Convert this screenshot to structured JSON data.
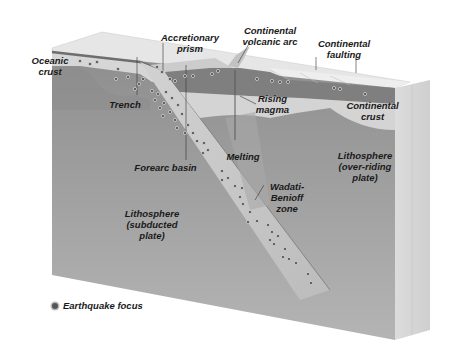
{
  "diagram": {
    "type": "block-diagram",
    "labels": {
      "oceanic_crust": "Oceanic\ncrust",
      "accretionary_prism": "Accretionary\nprism",
      "continental_volcanic_arc": "Continental\nvolcanic arc",
      "continental_faulting": "Continental\nfaulting",
      "trench": "Trench",
      "rising_magma": "Rising\nmagma",
      "continental_crust": "Continental\ncrust",
      "forearc_basin": "Forearc basin",
      "melting": "Melting",
      "lithosphere_overriding": "Lithosphere\n(over-riding\nplate)",
      "wadati_benioff_zone": "Wadati-\nBenioff\nzone",
      "lithosphere_subducted": "Lithosphere\n(subducted\nplate)"
    },
    "legend": {
      "earthquake_focus": "Earthquake focus"
    },
    "colors": {
      "block_front": "#9a9a9a",
      "crust_top": "#dcdcdc",
      "oceanic_layer": "#7e7e7e",
      "continental_crust": "#d0d0d0",
      "slab": "#c8c8c8",
      "earthquake_dot": "#555555"
    }
  }
}
